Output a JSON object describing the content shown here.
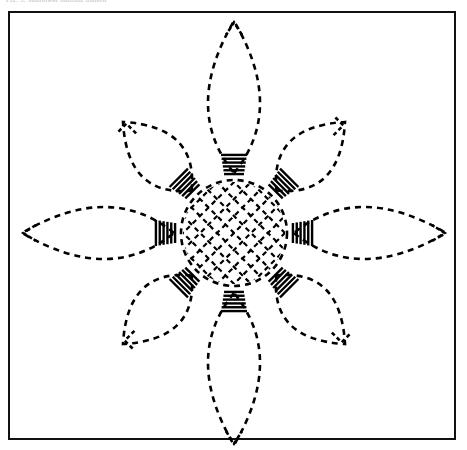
{
  "page": {
    "width": 467,
    "height": 450,
    "background_color": "#ffffff",
    "caption_text": "Fig. 5. Sunflower quilting pattern",
    "caption_color": "#b9b9b9"
  },
  "frame": {
    "name": "pattern-border",
    "x": 8,
    "y": 11,
    "width": 448,
    "height": 429,
    "stroke_color": "#111111",
    "stroke_width": 2
  },
  "artwork": {
    "title": "Eight-petal sunflower quilting pattern",
    "style": "dashed stitch line drawing",
    "line_color": "#000000",
    "fill_color": "none",
    "center": {
      "x": 234,
      "y": 233
    },
    "dash_pattern": "6 5",
    "stroke_width": 2.6
  },
  "chart_data": {
    "type": "diagram",
    "center": {
      "cx": 234,
      "cy": 233
    },
    "center_circle": {
      "name": "center-circle",
      "radius": 53,
      "dash": "6 5",
      "lattice": {
        "type": "diagonal-crosshatch",
        "angle_degrees": 45,
        "spacing": 12,
        "dash": "5 4",
        "stroke_width": 2.2
      }
    },
    "comb_ring": {
      "name": "comb-ring",
      "count": 8,
      "inner_radius": 57,
      "outer_radius": 80,
      "stripes_per_comb": 6,
      "stripe_half_span": 13,
      "stroke_width": 2.4,
      "angles_degrees": [
        0,
        45,
        90,
        135,
        180,
        225,
        270,
        315
      ]
    },
    "petals": [
      {
        "index": 0,
        "name": "petal-north",
        "angle_degrees": -90,
        "length": 212,
        "half_width": 52,
        "tip_notch": "v-notch",
        "kind": "cardinal"
      },
      {
        "index": 1,
        "name": "petal-northeast",
        "angle_degrees": -45,
        "length": 157,
        "half_width": 50,
        "tip_notch": "square-notch",
        "kind": "diagonal"
      },
      {
        "index": 2,
        "name": "petal-east",
        "angle_degrees": 0,
        "length": 212,
        "half_width": 52,
        "tip_notch": "v-notch",
        "kind": "cardinal"
      },
      {
        "index": 3,
        "name": "petal-southeast",
        "angle_degrees": 45,
        "length": 157,
        "half_width": 50,
        "tip_notch": "square-notch",
        "kind": "diagonal"
      },
      {
        "index": 4,
        "name": "petal-south",
        "angle_degrees": 90,
        "length": 212,
        "half_width": 52,
        "tip_notch": "v-notch",
        "kind": "cardinal"
      },
      {
        "index": 5,
        "name": "petal-southwest",
        "angle_degrees": 135,
        "length": 157,
        "half_width": 50,
        "tip_notch": "square-notch",
        "kind": "diagonal"
      },
      {
        "index": 6,
        "name": "petal-west",
        "angle_degrees": 180,
        "length": 212,
        "half_width": 52,
        "tip_notch": "v-notch",
        "kind": "cardinal"
      },
      {
        "index": 7,
        "name": "petal-northwest",
        "angle_degrees": -135,
        "length": 157,
        "half_width": 50,
        "tip_notch": "square-notch",
        "kind": "diagonal"
      }
    ],
    "petal_base_radius": 60
  }
}
